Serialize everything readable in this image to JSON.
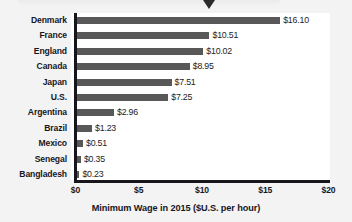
{
  "figure": {
    "background_color": "#f3f3f3",
    "plot_background_color": "#ffffff",
    "bar_color": "#585858",
    "axis_color": "#16161c",
    "text_color": "#17171f",
    "banner_pointer_icon": "triangle-down-pointer-icon"
  },
  "chart_data": {
    "type": "bar",
    "orientation": "horizontal",
    "title": "",
    "xlabel": "Minimum Wage in 2015 ($U.S. per hour)",
    "ylabel": "",
    "xlim": [
      0,
      20
    ],
    "grid": false,
    "legend": null,
    "xticks": [
      0,
      5,
      10,
      15,
      20
    ],
    "xtick_labels": [
      "$0",
      "$5",
      "$10",
      "$15",
      "$20"
    ],
    "categories": [
      "Denmark",
      "France",
      "England",
      "Canada",
      "Japan",
      "U.S.",
      "Argentina",
      "Brazil",
      "Mexico",
      "Senegal",
      "Bangladesh"
    ],
    "values": [
      16.1,
      10.51,
      10.02,
      8.95,
      7.51,
      7.25,
      2.96,
      1.23,
      0.51,
      0.35,
      0.23
    ],
    "value_labels": [
      "$16.10",
      "$10.51",
      "$10.02",
      "$8.95",
      "$7.51",
      "$7.25",
      "$2.96",
      "$1.23",
      "$0.51",
      "$0.35",
      "$0.23"
    ]
  }
}
